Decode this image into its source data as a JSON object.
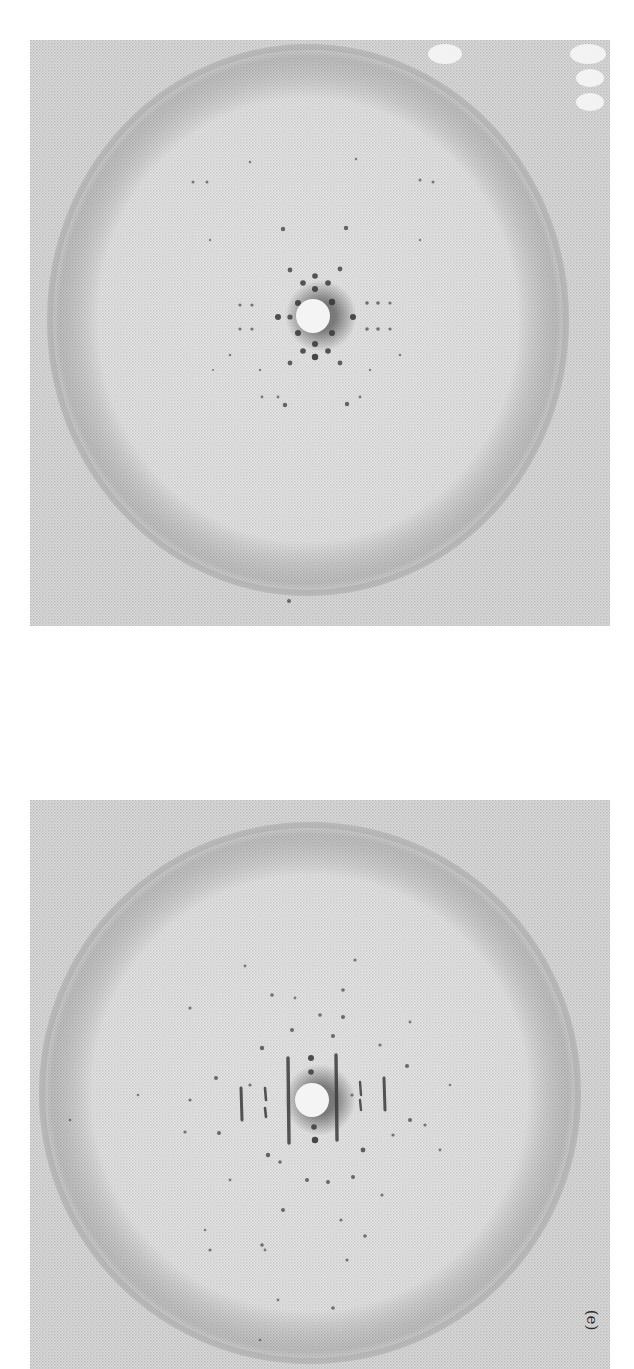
{
  "figure": {
    "panel_label": "(e)",
    "colors": {
      "film_background": "#d2d2d2",
      "ring": "#a8a8a8",
      "spot": "#3a3a3a",
      "beam_stop": "#f4f4f4"
    },
    "panels": [
      {
        "id": "top",
        "description": "X-ray diffraction photograph with square lattice of spots around central beam stop",
        "circle": {
          "cx": 278,
          "cy": 280,
          "rx": 262,
          "ry": 277
        },
        "beam_stop": {
          "cx": 283,
          "cy": 276,
          "r": 17
        },
        "spots": [
          [
            253,
            189,
            2.2
          ],
          [
            316,
            188,
            2.2
          ],
          [
            260,
            230,
            2.4
          ],
          [
            285,
            236,
            2.8
          ],
          [
            310,
            229,
            2.4
          ],
          [
            273,
            243,
            2.8
          ],
          [
            285,
            249,
            3
          ],
          [
            298,
            243,
            2.8
          ],
          [
            248,
            277,
            3
          ],
          [
            260,
            277,
            2.6
          ],
          [
            323,
            277,
            3
          ],
          [
            268,
            263,
            3
          ],
          [
            302,
            262,
            3.2
          ],
          [
            302,
            293,
            3
          ],
          [
            268,
            293,
            3
          ],
          [
            285,
            304,
            3
          ],
          [
            273,
            311,
            2.8
          ],
          [
            285,
            317,
            3.2
          ],
          [
            298,
            311,
            2.8
          ],
          [
            260,
            323,
            2.4
          ],
          [
            310,
            323,
            2.4
          ],
          [
            255,
            365,
            2.2
          ],
          [
            317,
            364,
            2.2
          ],
          [
            210,
            265,
            1.6
          ],
          [
            222,
            265,
            1.6
          ],
          [
            337,
            263,
            1.8
          ],
          [
            348,
            263,
            1.8
          ],
          [
            360,
            263,
            1.6
          ],
          [
            210,
            289,
            1.6
          ],
          [
            222,
            289,
            1.6
          ],
          [
            337,
            289,
            1.8
          ],
          [
            348,
            289,
            1.8
          ],
          [
            360,
            289,
            1.6
          ],
          [
            163,
            142,
            1.5
          ],
          [
            177,
            142,
            1.5
          ],
          [
            390,
            140,
            1.5
          ],
          [
            403,
            142,
            1.5
          ],
          [
            220,
            122,
            1.3
          ],
          [
            326,
            119,
            1.3
          ],
          [
            259,
            561,
            2
          ],
          [
            200,
            315,
            1.3
          ],
          [
            370,
            315,
            1.3
          ],
          [
            230,
            330,
            1.2
          ],
          [
            340,
            330,
            1.2
          ],
          [
            183,
            330,
            1.1
          ],
          [
            390,
            200,
            1.2
          ],
          [
            180,
            200,
            1.2
          ],
          [
            232,
            357,
            1.4
          ],
          [
            248,
            357,
            1.4
          ],
          [
            330,
            357,
            1.4
          ]
        ],
        "white_blobs": [
          {
            "cx": 415,
            "cy": 14,
            "rx": 17,
            "ry": 10
          },
          {
            "cx": 558,
            "cy": 14,
            "rx": 18,
            "ry": 10
          },
          {
            "cx": 560,
            "cy": 38,
            "rx": 14,
            "ry": 9
          },
          {
            "cx": 560,
            "cy": 62,
            "rx": 14,
            "ry": 9
          }
        ]
      },
      {
        "id": "bottom",
        "description": "X-ray diffraction photograph with vertical streaked reflections around central beam stop",
        "circle": {
          "cx": 280,
          "cy": 293,
          "rx": 272,
          "ry": 272
        },
        "beam_stop": {
          "cx": 282,
          "cy": 300,
          "r": 17
        },
        "streaks": [
          {
            "x": 258,
            "y1": 258,
            "y2": 343,
            "w": 3.4
          },
          {
            "x": 306,
            "y1": 255,
            "y2": 340,
            "w": 3.4
          },
          {
            "x": 211,
            "y1": 288,
            "y2": 320,
            "w": 3
          },
          {
            "x": 354,
            "y1": 278,
            "y2": 310,
            "w": 3
          },
          {
            "x": 235,
            "y1": 288,
            "y2": 300,
            "w": 2.6
          },
          {
            "x": 235,
            "y1": 308,
            "y2": 317,
            "w": 2.6
          },
          {
            "x": 330,
            "y1": 282,
            "y2": 295,
            "w": 2.4
          },
          {
            "x": 330,
            "y1": 300,
            "y2": 310,
            "w": 2.4
          }
        ],
        "spots": [
          [
            281,
            258,
            3
          ],
          [
            281,
            272,
            2.8
          ],
          [
            284,
            327,
            2.8
          ],
          [
            285,
            340,
            3.2
          ],
          [
            232,
            248,
            2.2
          ],
          [
            186,
            278,
            2
          ],
          [
            189,
            333,
            2
          ],
          [
            238,
            355,
            2.2
          ],
          [
            333,
            350,
            2.4
          ],
          [
            380,
            320,
            2
          ],
          [
            377,
            266,
            2
          ],
          [
            313,
            217,
            2
          ],
          [
            290,
            215,
            1.8
          ],
          [
            242,
            195,
            1.8
          ],
          [
            313,
            190,
            1.8
          ],
          [
            250,
            362,
            1.8
          ],
          [
            277,
            380,
            2
          ],
          [
            298,
            382,
            2
          ],
          [
            323,
            377,
            2
          ],
          [
            253,
            410,
            2
          ],
          [
            220,
            285,
            1.6
          ],
          [
            322,
            295,
            1.6
          ],
          [
            262,
            230,
            2
          ],
          [
            303,
            236,
            2
          ],
          [
            160,
            300,
            1.6
          ],
          [
            155,
            332,
            1.6
          ],
          [
            350,
            245,
            1.6
          ],
          [
            395,
            325,
            1.6
          ],
          [
            410,
            350,
            1.4
          ],
          [
            352,
            395,
            1.6
          ],
          [
            200,
            380,
            1.4
          ],
          [
            180,
            450,
            1.6
          ],
          [
            232,
            445,
            1.8
          ],
          [
            335,
            436,
            1.8
          ],
          [
            311,
            420,
            1.6
          ],
          [
            363,
            335,
            1.6
          ],
          [
            160,
            208,
            1.6
          ],
          [
            325,
            160,
            1.6
          ],
          [
            215,
            166,
            1.4
          ],
          [
            265,
            198,
            1.4
          ],
          [
            235,
            450,
            1.4
          ],
          [
            317,
            460,
            1.6
          ],
          [
            303,
            508,
            1.8
          ],
          [
            248,
            500,
            1.4
          ],
          [
            380,
            222,
            1.4
          ],
          [
            108,
            295,
            1.3
          ],
          [
            40,
            320,
            1.3
          ],
          [
            420,
            285,
            1.3
          ],
          [
            175,
            430,
            1.3
          ],
          [
            230,
            540,
            1.3
          ]
        ]
      }
    ]
  }
}
